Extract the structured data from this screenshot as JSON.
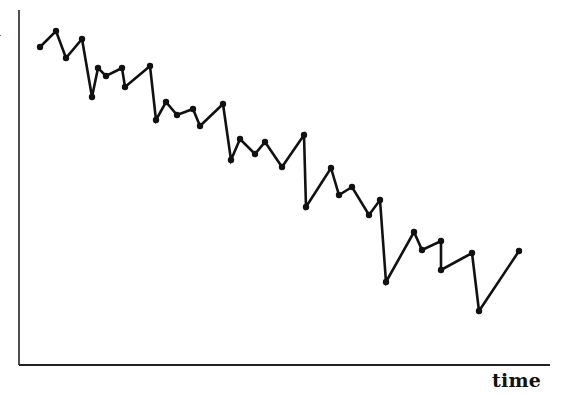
{
  "chart_data": {
    "type": "line",
    "title": "",
    "xlabel": "time",
    "ylabel": "",
    "grid": false,
    "legend": null,
    "ticks": {
      "x": [],
      "y": []
    },
    "axes_px": {
      "origin": [
        19,
        365
      ],
      "x_end": [
        550,
        365
      ],
      "y_top": [
        19,
        10
      ]
    },
    "series": [
      {
        "name": "series",
        "color": "#111111",
        "marker": "dot",
        "points_px": [
          [
            40,
            47
          ],
          [
            56,
            31
          ],
          [
            66,
            58
          ],
          [
            82,
            39
          ],
          [
            92,
            97
          ],
          [
            98,
            68
          ],
          [
            106,
            76
          ],
          [
            122,
            68
          ],
          [
            125,
            87
          ],
          [
            150,
            66
          ],
          [
            156,
            120
          ],
          [
            166,
            102
          ],
          [
            177,
            115
          ],
          [
            193,
            109
          ],
          [
            200,
            126
          ],
          [
            223,
            104
          ],
          [
            231,
            160
          ],
          [
            240,
            139
          ],
          [
            255,
            154
          ],
          [
            265,
            142
          ],
          [
            282,
            167
          ],
          [
            304,
            135
          ],
          [
            306,
            207
          ],
          [
            331,
            168
          ],
          [
            339,
            195
          ],
          [
            352,
            187
          ],
          [
            369,
            215
          ],
          [
            380,
            200
          ],
          [
            386,
            282
          ],
          [
            414,
            232
          ],
          [
            422,
            250
          ],
          [
            441,
            241
          ],
          [
            441,
            270
          ],
          [
            472,
            253
          ],
          [
            479,
            311
          ],
          [
            519,
            251
          ]
        ],
        "values_relative_0_to_100": [
          93.1,
          97.7,
          90.0,
          95.4,
          78.8,
          87.1,
          84.8,
          87.1,
          81.7,
          88.8,
          73.4,
          78.5,
          74.8,
          76.5,
          71.6,
          77.9,
          61.9,
          67.9,
          63.6,
          67.1,
          59.9,
          69.1,
          48.4,
          59.6,
          51.9,
          54.2,
          46.1,
          50.4,
          27.0,
          41.3,
          36.1,
          38.7,
          30.4,
          35.2,
          18.6,
          35.8
        ]
      }
    ]
  },
  "labels": {
    "x_axis": "time",
    "y_axis_fragment": "l"
  }
}
